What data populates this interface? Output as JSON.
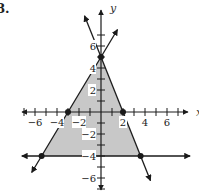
{
  "problem": {
    "number": "8."
  },
  "chart_data": {
    "type": "line",
    "title": "",
    "xlabel": "x",
    "ylabel": "y",
    "xlim": [
      -7.3,
      7.9
    ],
    "ylim": [
      -7,
      8
    ],
    "x_ticks": [
      -6,
      -4,
      -2,
      2,
      4,
      6
    ],
    "y_ticks": [
      -6,
      -4,
      -2,
      2,
      4,
      6
    ],
    "x_tick_labels": [
      "-6",
      "-4",
      "-2",
      "2",
      "4",
      "6"
    ],
    "y_tick_labels": [
      "-6",
      "-4",
      "-2",
      "2",
      "4",
      "6"
    ],
    "grid": false,
    "series": [
      {
        "name": "y = (5/3)x + 5",
        "points": [
          [
            -6.3,
            -5.5
          ],
          [
            0,
            5
          ],
          [
            1.5,
            7.5
          ]
        ]
      },
      {
        "name": "y = -(5/2)x + 5",
        "points": [
          [
            -1.5,
            8.75
          ],
          [
            0,
            5
          ],
          [
            4.5,
            -6.25
          ]
        ]
      },
      {
        "name": "y = -4",
        "points": [
          [
            -7.2,
            -4
          ],
          [
            8.1,
            -4
          ]
        ]
      }
    ],
    "points": [
      {
        "label": "y-intercept",
        "x": 0,
        "y": 5
      },
      {
        "label": "x-intercept left",
        "x": -3,
        "y": 0
      },
      {
        "label": "x-intercept right",
        "x": 2,
        "y": 0
      },
      {
        "label": "corner left",
        "x": -5.4,
        "y": -4
      },
      {
        "label": "corner right",
        "x": 3.6,
        "y": -4
      }
    ],
    "shaded_region": {
      "description": "Feasible region: triangle bounded by the two lines and y = -4",
      "vertices": [
        [
          0,
          5
        ],
        [
          -5.4,
          -4
        ],
        [
          3.6,
          -4
        ]
      ],
      "color": "#c8c8c8"
    },
    "colors": {
      "line": "#1a1a1a",
      "shade": "#c8c8c8",
      "label_bg": "#ffffff"
    }
  }
}
